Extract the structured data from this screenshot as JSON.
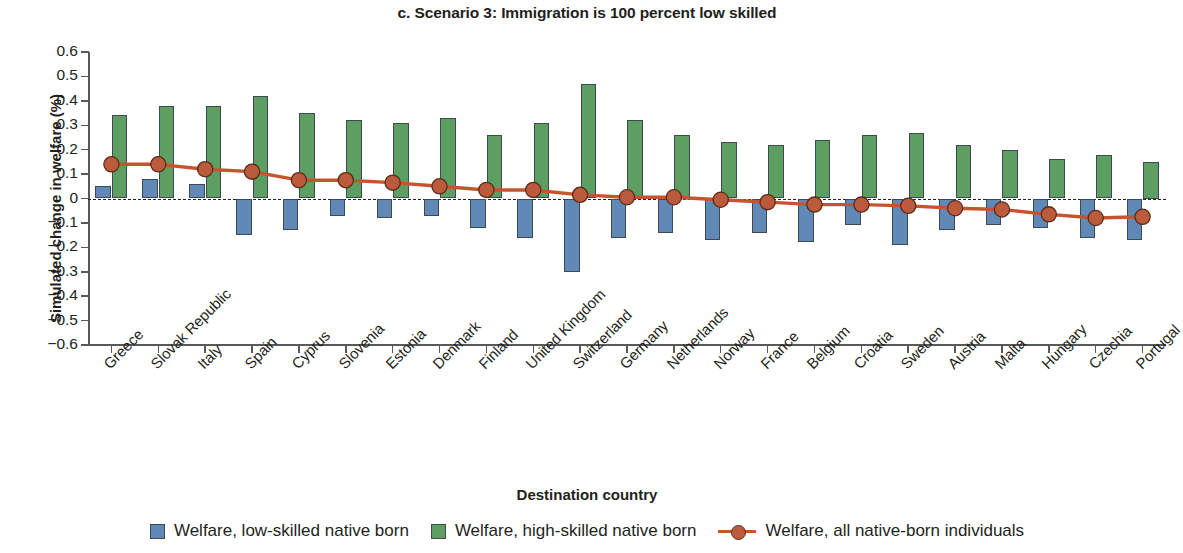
{
  "chart_data": {
    "type": "bar",
    "title": "c. Scenario 3: Immigration is 100 percent low skilled",
    "xlabel": "Destination country",
    "ylabel": "Simulated change in welfare (%)",
    "ylim": [
      -0.6,
      0.6
    ],
    "ytick_labels": [
      "0.6",
      "0.5",
      "0.4",
      "0.3",
      "0.2",
      "0.1",
      "0",
      "−0.1",
      "−0.2",
      "−0.3",
      "−0.4",
      "−0.5",
      "−0.6"
    ],
    "yticks": [
      0.6,
      0.5,
      0.4,
      0.3,
      0.2,
      0.1,
      0,
      -0.1,
      -0.2,
      -0.3,
      -0.4,
      -0.5,
      -0.6
    ],
    "grid": false,
    "zero_reference_line": true,
    "legend_position": "bottom",
    "categories": [
      "Greece",
      "Slovak Republic",
      "Italy",
      "Spain",
      "Cyprus",
      "Slovenia",
      "Estonia",
      "Denmark",
      "Finland",
      "United Kingdom",
      "Switzerland",
      "Germany",
      "Netherlands",
      "Norway",
      "France",
      "Belgium",
      "Croatia",
      "Sweden",
      "Austria",
      "Malta",
      "Hungary",
      "Czechia",
      "Portugal"
    ],
    "series": [
      {
        "name": "Welfare, low-skilled native born",
        "type": "bar",
        "color": "#6189b8",
        "values": [
          0.05,
          0.08,
          0.06,
          -0.15,
          -0.13,
          -0.07,
          -0.08,
          -0.07,
          -0.12,
          -0.16,
          -0.3,
          -0.16,
          -0.14,
          -0.17,
          -0.14,
          -0.18,
          -0.11,
          -0.19,
          -0.13,
          -0.11,
          -0.12,
          -0.16,
          -0.17
        ]
      },
      {
        "name": "Welfare, high-skilled native born",
        "type": "bar",
        "color": "#5d9e63",
        "values": [
          0.34,
          0.38,
          0.38,
          0.42,
          0.35,
          0.32,
          0.31,
          0.33,
          0.26,
          0.31,
          0.47,
          0.32,
          0.26,
          0.23,
          0.22,
          0.24,
          0.26,
          0.27,
          0.22,
          0.2,
          0.16,
          0.18,
          0.15
        ]
      },
      {
        "name": "Welfare, all native-born individuals",
        "type": "line",
        "color": "#c4562f",
        "marker_color": "#bc5b3c",
        "values": [
          0.14,
          0.14,
          0.12,
          0.11,
          0.075,
          0.075,
          0.065,
          0.05,
          0.035,
          0.035,
          0.015,
          0.005,
          0.005,
          -0.005,
          -0.015,
          -0.025,
          -0.025,
          -0.03,
          -0.04,
          -0.045,
          -0.065,
          -0.08,
          -0.075
        ]
      }
    ]
  },
  "legend": {
    "items": [
      {
        "label": "Welfare, low-skilled native born",
        "marker": "square-swatch-blue"
      },
      {
        "label": "Welfare, high-skilled native born",
        "marker": "square-swatch-green"
      },
      {
        "label": "Welfare, all native-born individuals",
        "marker": "line-with-circle-marker"
      }
    ]
  },
  "colors": {
    "low_skilled_bar": "#6189b8",
    "high_skilled_bar": "#5d9e63",
    "all_native_line": "#c4562f",
    "all_native_marker": "#bc5b3c",
    "axis": "#58595b",
    "text": "#231f20"
  }
}
